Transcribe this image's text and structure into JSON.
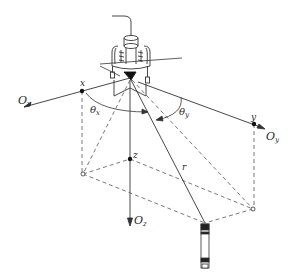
{
  "diagram": {
    "type": "3D coordinate geometry schematic",
    "colors": {
      "line": "#333333",
      "dashed": "#555555",
      "background": "#ffffff"
    },
    "origin_device": "sensor-array",
    "axes": [
      {
        "id": "x",
        "main": "O",
        "sub": "x"
      },
      {
        "id": "y",
        "main": "O",
        "sub": "y"
      },
      {
        "id": "z",
        "main": "O",
        "sub": "z"
      }
    ],
    "points": {
      "x": "x",
      "y": "y",
      "z": "z"
    },
    "angles": [
      {
        "id": "theta_x",
        "main": "θ",
        "sub": "x"
      },
      {
        "id": "theta_y",
        "main": "θ",
        "sub": "y"
      }
    ],
    "vector": {
      "label": "r"
    },
    "target": "probe"
  }
}
